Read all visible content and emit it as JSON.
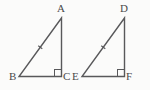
{
  "figure": {
    "background_color": "#fbfbfa",
    "stroke_color": "#58585a",
    "label_color": "#4a4a4a",
    "stroke_width": 1.4
  },
  "triangles": [
    {
      "name": "triangle-abc",
      "vertices": [
        {
          "id": "A",
          "label": "A",
          "x": 61.5,
          "y": 18.0,
          "label_x": 57,
          "label_y": 3
        },
        {
          "id": "B",
          "label": "B",
          "x": 19.0,
          "y": 76.5,
          "label_x": 9,
          "label_y": 71
        },
        {
          "id": "C",
          "label": "C",
          "x": 61.5,
          "y": 76.5,
          "label_x": 63,
          "label_y": 71
        }
      ],
      "right_angle_at": "C",
      "right_angle_marker": {
        "x": 54.5,
        "y": 69.5,
        "size": 7
      },
      "hypotenuse": {
        "from": "A",
        "to": "B",
        "tick_marks": 1,
        "tick_at": 0.5,
        "tick_length": 5
      }
    },
    {
      "name": "triangle-def",
      "vertices": [
        {
          "id": "D",
          "label": "D",
          "x": 124.5,
          "y": 18.0,
          "label_x": 120,
          "label_y": 3
        },
        {
          "id": "E",
          "label": "E",
          "x": 82.0,
          "y": 76.5,
          "label_x": 72,
          "label_y": 71
        },
        {
          "id": "F",
          "label": "F",
          "x": 124.5,
          "y": 76.5,
          "label_x": 126,
          "label_y": 71
        }
      ],
      "right_angle_at": "F",
      "right_angle_marker": {
        "x": 117.5,
        "y": 69.5,
        "size": 7
      },
      "hypotenuse": {
        "from": "D",
        "to": "E",
        "tick_marks": 1,
        "tick_at": 0.5,
        "tick_length": 5
      }
    }
  ]
}
